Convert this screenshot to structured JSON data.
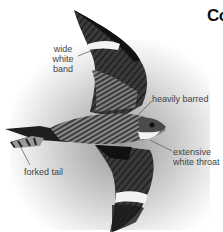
{
  "page": {
    "title_fragment": "Co"
  },
  "illustration": {
    "subject": "nighthawk-in-flight",
    "colors": {
      "plumage_dark": "#1e1e1e",
      "plumage_mid": "#6a6a6a",
      "white_marks": "#f2f2f2",
      "halo": "#bdbdbd",
      "label_text": "#444444",
      "leader_line": "#555555"
    },
    "labels": [
      {
        "line1": "wide",
        "line2": "white",
        "line3": "band"
      },
      {
        "text": "heavily barred"
      },
      {
        "line1": "extensive",
        "line2": "white throat"
      },
      {
        "text": "forked tail"
      }
    ]
  }
}
